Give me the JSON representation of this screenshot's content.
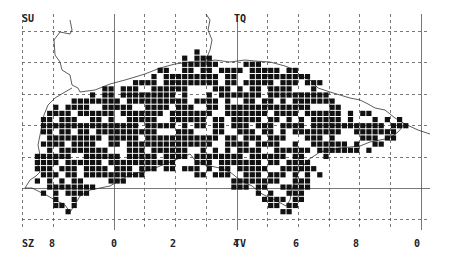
{
  "map": {
    "type": "distribution grid map",
    "colors": {
      "cell": "#111111",
      "grid": "#555555",
      "coast": "#333333",
      "background": "#ffffff"
    },
    "square_labels": [
      {
        "text": "SU",
        "x": 22,
        "y": 14
      },
      {
        "text": "TQ",
        "x": 234,
        "y": 14
      },
      {
        "text": "SZ",
        "x": 22,
        "y": 239
      },
      {
        "text": "TV",
        "x": 234,
        "y": 239
      }
    ],
    "easting_labels": [
      {
        "text": "8",
        "x": 49,
        "y": 239
      },
      {
        "text": "0",
        "x": 111,
        "y": 239
      },
      {
        "text": "2",
        "x": 170,
        "y": 239
      },
      {
        "text": "4",
        "x": 233,
        "y": 239
      },
      {
        "text": "6",
        "x": 293,
        "y": 239
      },
      {
        "text": "8",
        "x": 353,
        "y": 239
      },
      {
        "text": "0",
        "x": 414,
        "y": 239
      }
    ],
    "grid": {
      "dashed_x": [
        22,
        53,
        144,
        175,
        206,
        267,
        298,
        329,
        359,
        390
      ],
      "solid_x": [
        114,
        237,
        421
      ],
      "dashed_y": [
        31,
        62,
        94,
        125,
        157,
        219
      ],
      "solid_y": [
        188
      ],
      "x_min": 22,
      "x_max": 430,
      "y_min": 14,
      "y_max": 230
    },
    "cells": {
      "origin_x": 22.5,
      "origin_y": 31,
      "pitch": 6.14,
      "size": 5.2,
      "rows": [
        {
          "r": 3,
          "spans": [
            [
              28,
              28
            ]
          ]
        },
        {
          "r": 4,
          "spans": [
            [
              26,
              30
            ]
          ]
        },
        {
          "r": 5,
          "spans": [
            [
              25,
              31
            ],
            [
              35,
              39
            ]
          ]
        },
        {
          "r": 6,
          "spans": [
            [
              22,
              44
            ]
          ]
        },
        {
          "r": 7,
          "spans": [
            [
              21,
              46
            ]
          ]
        },
        {
          "r": 8,
          "spans": [
            [
              18,
              48
            ]
          ]
        },
        {
          "r": 9,
          "spans": [
            [
              13,
              48
            ]
          ]
        },
        {
          "r": 10,
          "spans": [
            [
              11,
              49
            ]
          ]
        },
        {
          "r": 11,
          "spans": [
            [
              8,
              50
            ]
          ]
        },
        {
          "r": 12,
          "spans": [
            [
              5,
              51
            ]
          ]
        },
        {
          "r": 13,
          "spans": [
            [
              4,
              57
            ]
          ]
        },
        {
          "r": 14,
          "spans": [
            [
              3,
              61
            ]
          ]
        },
        {
          "r": 15,
          "spans": [
            [
              3,
              62
            ]
          ]
        },
        {
          "r": 16,
          "spans": [
            [
              3,
              61
            ]
          ]
        },
        {
          "r": 17,
          "spans": [
            [
              3,
              60
            ]
          ]
        },
        {
          "r": 18,
          "spans": [
            [
              3,
              58
            ]
          ]
        },
        {
          "r": 19,
          "spans": [
            [
              2,
              57
            ]
          ]
        },
        {
          "r": 20,
          "spans": [
            [
              2,
              50
            ]
          ]
        },
        {
          "r": 21,
          "spans": [
            [
              2,
              46
            ]
          ]
        },
        {
          "r": 22,
          "spans": [
            [
              2,
              48
            ]
          ]
        },
        {
          "r": 23,
          "spans": [
            [
              2,
              19
            ],
            [
              27,
              48
            ]
          ]
        },
        {
          "r": 24,
          "spans": [
            [
              2,
              9
            ],
            [
              14,
              16
            ],
            [
              34,
              47
            ]
          ]
        },
        {
          "r": 25,
          "spans": [
            [
              2,
              11
            ],
            [
              34,
              46
            ]
          ]
        },
        {
          "r": 26,
          "spans": [
            [
              3,
              11
            ],
            [
              38,
              45
            ]
          ]
        },
        {
          "r": 27,
          "spans": [
            [
              4,
              9
            ],
            [
              39,
              45
            ]
          ]
        },
        {
          "r": 28,
          "spans": [
            [
              5,
              8
            ],
            [
              40,
              44
            ]
          ]
        },
        {
          "r": 29,
          "spans": [
            [
              6,
              7
            ],
            [
              42,
              44
            ]
          ]
        }
      ],
      "gap_density": 0.22,
      "seed": 7
    },
    "coastline": "M70,20 L72,30 L70,34 L60,32 L54,40 L55,55 L60,62 L62,70 L70,75 L72,85 L78,88 L80,92 L95,90 L110,84 L125,80 L145,74 L160,68 L175,64 L190,62 L205,62 L215,60 L230,62 L245,60 L255,61 L270,62 L285,66 L295,70 L300,75 L310,80 L318,88 L330,92 L340,95 L350,98 L360,100 L368,104 L375,108 L385,110 L395,118 L405,124 L418,130 L430,134 M405,124 L398,132 L390,138 L380,140 L370,142 L360,146 L340,148 L330,150 L320,152 L308,160 L300,170 L296,178 L292,190 L290,200 L286,206 M286,206 L275,200 L262,194 L252,186 L240,180 L230,172 L220,168 L205,165 L195,160 L190,154 L180,158 L170,162 L160,166 L150,170 L140,172 L128,176 L120,180 L110,186 L100,188 L90,190 L80,196 L74,206 L70,212 L65,205 L55,200 L48,196 L40,192 L32,188 L25,188 M25,188 L30,180 L36,176 L40,172 L38,165 L40,155 L38,145 L40,135 L42,125 L44,115 L48,105 L55,98 L65,92 L72,88 M205,62 L210,50 L212,40 L208,30 L210,20 L206,14"
  }
}
